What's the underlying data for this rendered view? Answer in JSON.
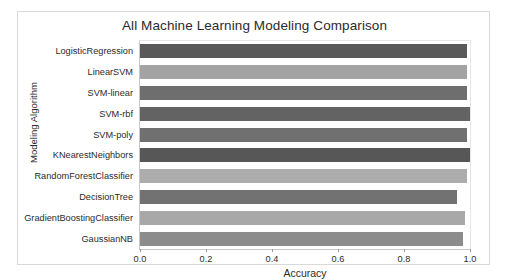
{
  "figure": {
    "background_color": "#ffffff",
    "border_color": "#d9d9d9"
  },
  "chart_data": {
    "type": "bar",
    "orientation": "horizontal",
    "title": "All Machine Learning Modeling Comparison",
    "xlabel": "Accuracy",
    "ylabel": "Modeling Algorithm",
    "xlim": [
      0.0,
      1.0
    ],
    "xticks": [
      "0.0",
      "0.2",
      "0.4",
      "0.6",
      "0.8",
      "1.0"
    ],
    "xtick_values": [
      0.0,
      0.2,
      0.4,
      0.6,
      0.8,
      1.0
    ],
    "grid": false,
    "legend": "none",
    "categories": [
      "LogisticRegression",
      "LinearSVM",
      "SVM-linear",
      "SVM-rbf",
      "SVM-poly",
      "KNearestNeighbors",
      "RandomForestClassifier",
      "DecisionTree",
      "GradientBoostingClassifier",
      "GaussianNB"
    ],
    "values": [
      0.99,
      0.99,
      0.99,
      1.0,
      0.99,
      1.0,
      0.99,
      0.96,
      0.985,
      0.98
    ],
    "bar_colors": [
      "#595959",
      "#a3a3a3",
      "#6e6e6e",
      "#636363",
      "#707070",
      "#575757",
      "#adadad",
      "#727272",
      "#a8a8a8",
      "#8c8c8c"
    ]
  }
}
